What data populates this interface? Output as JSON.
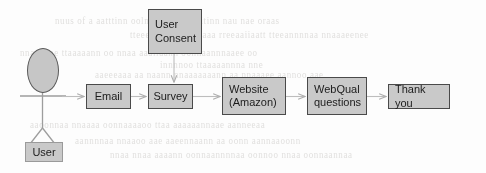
{
  "diagram": {
    "background_color": "#fdfdfd",
    "node_fill": "#c9c9c9",
    "node_border": "#4a4a4a",
    "connector_color": "#b9b9b9",
    "actor": {
      "name": "actor-user",
      "label": "User",
      "head_fill": "#c6c6c6",
      "head_border": "#5a5a5a"
    },
    "nodes": [
      {
        "id": "user-consent",
        "lines": [
          "User",
          "Consent"
        ],
        "x": 148,
        "y": 9,
        "w": 54,
        "h": 45,
        "align": "left"
      },
      {
        "id": "email",
        "lines": [
          "Email"
        ],
        "x": 86,
        "y": 84,
        "w": 45,
        "h": 25,
        "align": "center"
      },
      {
        "id": "survey",
        "lines": [
          "Survey"
        ],
        "x": 148,
        "y": 84,
        "w": 45,
        "h": 25,
        "align": "center"
      },
      {
        "id": "website",
        "lines": [
          "Website",
          "(Amazon)"
        ],
        "x": 222,
        "y": 77,
        "w": 64,
        "h": 38,
        "align": "left"
      },
      {
        "id": "webqual",
        "lines": [
          "WebQual",
          "questions"
        ],
        "x": 307,
        "y": 77,
        "w": 60,
        "h": 38,
        "align": "left"
      },
      {
        "id": "thank-you",
        "lines": [
          "Thank you"
        ],
        "x": 388,
        "y": 84,
        "w": 62,
        "h": 25,
        "align": "left"
      }
    ],
    "edges": [
      {
        "id": "edge-user-to-email",
        "from": "actor-user",
        "to": "email"
      },
      {
        "id": "edge-email-to-survey",
        "from": "email",
        "to": "survey"
      },
      {
        "id": "edge-consent-to-survey",
        "from": "user-consent",
        "to": "survey"
      },
      {
        "id": "edge-survey-to-website",
        "from": "survey",
        "to": "website"
      },
      {
        "id": "edge-website-to-webqual",
        "from": "website",
        "to": "webqual"
      },
      {
        "id": "edge-webqual-to-thank-you",
        "from": "webqual",
        "to": "thank-you"
      }
    ],
    "ghost_text": [
      {
        "text": "nuus of  a  aatttinn  oolnnmmaaes  wiitinn nau  nae  oraas",
        "x": 55,
        "y": 16
      },
      {
        "text": "tteee ooeernniinnaaa   rreeaaiiaatt tteeannnnaa nnaaaeenee",
        "x": 130,
        "y": 30
      },
      {
        "text": "nnaaaooe    ttaaaaann oo nnaa aaaiiaann  oonnaannnaaee oo",
        "x": 20,
        "y": 48
      },
      {
        "text": "innnnoo  ttaaaaannna  nne",
        "x": 160,
        "y": 60
      },
      {
        "text": "aaeeeaaa  aa  naann  nnaaaaaaann  aa  nnaaaee  aannoo  aae",
        "x": 95,
        "y": 70
      },
      {
        "text": "aaoonnaa  nnaaaa oonnaaaaoo ttaa  aaaaaannaae aanneeaa",
        "x": 30,
        "y": 120
      },
      {
        "text": "aannnnaa  nnaaoo  aae  aaeennaann  aa  oonn  aannaaoonn",
        "x": 75,
        "y": 136
      },
      {
        "text": "nnaa nnaa  aaaann  oonnaannnnaa   oonnoo   nnaa  oonnaannaa",
        "x": 110,
        "y": 150
      }
    ]
  }
}
